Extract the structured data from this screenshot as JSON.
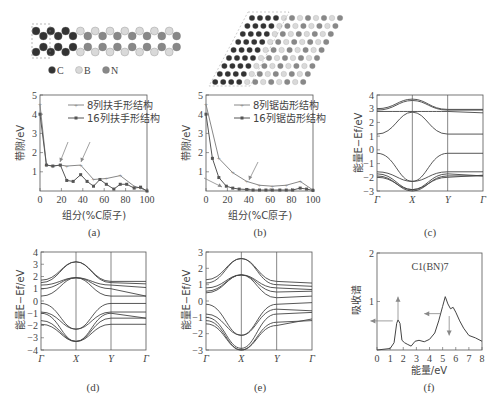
{
  "structures": {
    "legend": [
      {
        "symbol": "C",
        "color": "#333333"
      },
      {
        "symbol": "B",
        "color": "#d9d9d9"
      },
      {
        "symbol": "N",
        "color": "#888888"
      }
    ]
  },
  "panels": {
    "a": {
      "caption": "(a)",
      "xlabel": "组分(%C原子)",
      "ylabel": "带隙/eV"
    },
    "b": {
      "caption": "(b)",
      "xlabel": "组分(%C原子)",
      "ylabel": "带隙/eV"
    },
    "c": {
      "caption": "(c)",
      "ylabel": "能量E−Ef/eV"
    },
    "d": {
      "caption": "(d)",
      "ylabel": "能量E−Ef/eV"
    },
    "e": {
      "caption": "(e)",
      "ylabel": "能量E−Ef/eV"
    },
    "f": {
      "caption": "(f)",
      "xlabel": "能量/eV",
      "ylabel": "吸收谱",
      "annotation": "C1(BN)7"
    }
  },
  "chart_data": [
    {
      "id": "a",
      "type": "line",
      "title": "",
      "xlabel": "组分(%C原子)",
      "ylabel": "带隙/eV",
      "xlim": [
        0,
        100
      ],
      "ylim": [
        0,
        5
      ],
      "xticks": [
        0,
        20,
        40,
        60,
        80,
        100
      ],
      "yticks": [
        1,
        2,
        3,
        4,
        5
      ],
      "legend_position": "upper right",
      "series": [
        {
          "name": "8列扶手形结构",
          "marker": "+",
          "x": [
            0,
            6,
            12,
            19,
            25,
            38,
            50,
            62,
            75,
            88,
            94,
            100
          ],
          "y": [
            4.5,
            1.35,
            1.3,
            1.35,
            1.3,
            1.35,
            0.6,
            0.65,
            0.8,
            0.25,
            0.15,
            0.0
          ]
        },
        {
          "name": "16列扶手形结构",
          "marker": "■",
          "x": [
            0,
            6,
            12,
            19,
            25,
            31,
            38,
            44,
            50,
            56,
            62,
            69,
            75,
            81,
            88,
            94,
            100
          ],
          "y": [
            4.0,
            1.35,
            1.3,
            1.35,
            0.55,
            0.5,
            0.85,
            0.5,
            0.25,
            0.6,
            0.35,
            0.1,
            0.35,
            0.35,
            0.15,
            0.2,
            0.0
          ]
        }
      ],
      "annotations": [
        "arrow at ~20%",
        "arrow at ~40%"
      ]
    },
    {
      "id": "b",
      "type": "line",
      "title": "",
      "xlabel": "组分(%C原子)",
      "ylabel": "带隙/eV",
      "xlim": [
        0,
        100
      ],
      "ylim": [
        0,
        5
      ],
      "xticks": [
        0,
        20,
        40,
        60,
        80,
        100
      ],
      "yticks": [
        1,
        2,
        3,
        4,
        5
      ],
      "legend_position": "upper right",
      "series": [
        {
          "name": "8列锯齿形结构",
          "marker": "+",
          "x": [
            0,
            12,
            25,
            38,
            50,
            62,
            75,
            88,
            100
          ],
          "y": [
            4.5,
            1.7,
            0.95,
            0.5,
            0.3,
            0.25,
            0.3,
            0.5,
            0.05
          ]
        },
        {
          "name": "16列锯齿形结构",
          "marker": "■",
          "x": [
            0,
            6,
            12,
            19,
            25,
            31,
            38,
            44,
            50,
            56,
            62,
            69,
            75,
            81,
            88,
            94,
            100
          ],
          "y": [
            4.0,
            1.7,
            0.7,
            0.25,
            0.15,
            0.1,
            0.08,
            0.05,
            0.05,
            0.05,
            0.05,
            0.05,
            0.05,
            0.05,
            0.15,
            0.1,
            0.03
          ]
        }
      ],
      "annotations": [
        "arrow at ~40%",
        "arrow at ~12%"
      ]
    },
    {
      "id": "c",
      "type": "line",
      "title": "",
      "ylabel": "能量E−Ef/eV",
      "ylim": [
        -3,
        4
      ],
      "xticks": [
        "Γ",
        "X",
        "Y",
        "Γ"
      ],
      "yticks": [
        -3,
        -2,
        -1,
        0,
        1,
        2,
        3,
        4
      ]
    },
    {
      "id": "d",
      "type": "line",
      "title": "",
      "ylabel": "能量E−Ef/eV",
      "ylim": [
        -4,
        4
      ],
      "xticks": [
        "Γ",
        "X",
        "Y",
        "Γ"
      ],
      "yticks": [
        -4,
        -3,
        -2,
        -1,
        0,
        1,
        2,
        3,
        4
      ]
    },
    {
      "id": "e",
      "type": "line",
      "title": "",
      "ylabel": "能量E−Ef/eV",
      "ylim": [
        -3,
        3
      ],
      "xticks": [
        "Γ",
        "X",
        "Y",
        "Γ"
      ],
      "yticks": [
        -3,
        -2,
        -1,
        0,
        1,
        2,
        3
      ]
    },
    {
      "id": "f",
      "type": "line",
      "title": "C1(BN)7",
      "xlabel": "能量/eV",
      "ylabel": "吸收谱",
      "xlim": [
        0,
        8
      ],
      "ylim": [
        0,
        2
      ],
      "xticks": [
        0,
        1,
        2,
        3,
        4,
        5,
        6,
        7,
        8
      ],
      "yticks": [
        1,
        2
      ],
      "x": [
        0,
        1,
        1.3,
        1.5,
        1.6,
        1.75,
        1.9,
        2.1,
        2.3,
        2.6,
        2.9,
        3.2,
        3.6,
        4,
        4.4,
        4.7,
        5,
        5.2,
        5.4,
        5.6,
        5.8,
        6,
        6.3,
        6.6,
        7,
        7.5,
        8
      ],
      "y": [
        0,
        0.03,
        0.15,
        0.55,
        0.62,
        0.55,
        0.2,
        0.15,
        0.12,
        0.08,
        0.18,
        0.2,
        0.17,
        0.22,
        0.35,
        0.6,
        0.9,
        1.1,
        0.95,
        0.85,
        0.88,
        0.78,
        0.6,
        0.45,
        0.3,
        0.25,
        0.18
      ]
    }
  ]
}
